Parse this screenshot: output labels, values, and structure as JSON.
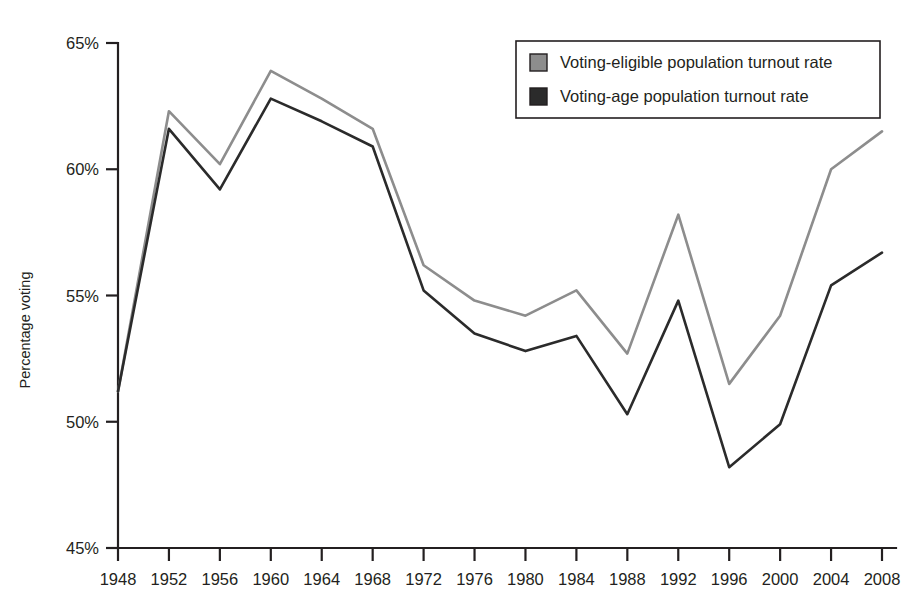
{
  "chart_data": {
    "type": "line",
    "title": "",
    "subtitle": "",
    "xlabel": "",
    "ylabel": "Percentage voting",
    "categories": [
      1948,
      1952,
      1956,
      1960,
      1964,
      1968,
      1972,
      1976,
      1980,
      1984,
      1988,
      1992,
      1996,
      2000,
      2004,
      2008
    ],
    "x_tick_labels": [
      "1948",
      "1952",
      "1956",
      "1960",
      "1964",
      "1968",
      "1972",
      "1976",
      "1980",
      "1984",
      "1988",
      "1992",
      "1996",
      "2000",
      "2004",
      "2008"
    ],
    "y_tick_labels": [
      "65%",
      "60%",
      "55%",
      "50%",
      "45%"
    ],
    "y_tick_values": [
      65,
      60,
      55,
      50,
      45
    ],
    "ylim": [
      45,
      65
    ],
    "xlim": [
      1948,
      2008
    ],
    "grid": false,
    "legend_position": "top-right",
    "series": [
      {
        "name": "Voting-eligible population turnout rate",
        "color": "#8d8d8d",
        "values": [
          51.2,
          62.3,
          60.2,
          63.9,
          62.8,
          61.6,
          56.2,
          54.8,
          54.2,
          55.2,
          52.7,
          58.2,
          51.5,
          54.2,
          60.0,
          61.5
        ]
      },
      {
        "name": "Voting-age population turnout rate",
        "color": "#2b2b2b",
        "values": [
          51.2,
          61.6,
          59.2,
          62.8,
          61.9,
          60.9,
          55.2,
          53.5,
          52.8,
          53.4,
          50.3,
          54.8,
          48.2,
          49.9,
          55.4,
          56.7
        ]
      }
    ]
  },
  "legend": {
    "items": [
      {
        "label": "Voting-eligible population turnout rate",
        "color": "#8d8d8d"
      },
      {
        "label": "Voting-age population turnout rate",
        "color": "#2b2b2b"
      }
    ]
  },
  "axes": {
    "y_axis_label": "Percentage voting"
  }
}
